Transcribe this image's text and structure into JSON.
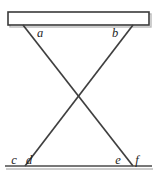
{
  "figure": {
    "canvas": {
      "width": 157,
      "height": 175,
      "background": "#ffffff"
    },
    "beam": {
      "name": "top-beam",
      "x": 8,
      "y": 12,
      "width": 141,
      "height": 13,
      "fill": "#ffffff",
      "stroke": "#3a3a3a"
    },
    "baseline": {
      "name": "bottom-baseline",
      "x1": 5,
      "y1": 166,
      "x2": 152,
      "y2": 166,
      "stroke": "#4a4a4a"
    },
    "lines": [
      {
        "name": "line-a-to-f",
        "x1": 23,
        "y1": 25,
        "x2": 133,
        "y2": 166,
        "stroke": "#3f3f3f"
      },
      {
        "name": "line-b-to-c",
        "x1": 133,
        "y1": 25,
        "x2": 25,
        "y2": 166,
        "stroke": "#3f3f3f"
      }
    ],
    "intersection": {
      "x": 78,
      "y": 97
    },
    "labels": [
      {
        "id": "a",
        "text": "a",
        "x": 40,
        "y": 37
      },
      {
        "id": "b",
        "text": "b",
        "x": 115,
        "y": 37
      },
      {
        "id": "c",
        "text": "c",
        "x": 14,
        "y": 164
      },
      {
        "id": "d",
        "text": "d",
        "x": 29,
        "y": 164
      },
      {
        "id": "e",
        "text": "e",
        "x": 118,
        "y": 164
      },
      {
        "id": "f",
        "text": "f",
        "x": 137,
        "y": 164
      }
    ]
  }
}
